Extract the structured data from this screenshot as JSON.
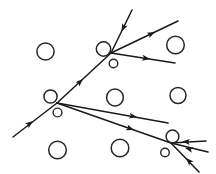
{
  "figure": {
    "width": 216,
    "height": 174,
    "background_color": "#ffffff",
    "stroke_color": "#1a1a1a",
    "circle_stroke_color": "#262626"
  },
  "scatterers": [
    {
      "name": "circle-top-left",
      "cx": 45.5,
      "cy": 51.5,
      "r": 8.6,
      "stroke_width": 1.5
    },
    {
      "name": "circle-vertex-a-left",
      "cx": 103.5,
      "cy": 49.0,
      "r": 7.2,
      "stroke_width": 1.5
    },
    {
      "name": "circle-vertex-a-small",
      "cx": 113.5,
      "cy": 63.5,
      "r": 4.3,
      "stroke_width": 1.4
    },
    {
      "name": "circle-top-right",
      "cx": 175.5,
      "cy": 45.0,
      "r": 8.8,
      "stroke_width": 1.5
    },
    {
      "name": "circle-vertex-b-left",
      "cx": 50.5,
      "cy": 96.5,
      "r": 6.6,
      "stroke_width": 1.5
    },
    {
      "name": "circle-vertex-b-small",
      "cx": 57.5,
      "cy": 112.5,
      "r": 4.4,
      "stroke_width": 1.4
    },
    {
      "name": "circle-center",
      "cx": 115.0,
      "cy": 97.5,
      "r": 8.4,
      "stroke_width": 1.5
    },
    {
      "name": "circle-mid-right",
      "cx": 178.0,
      "cy": 95.5,
      "r": 8.0,
      "stroke_width": 1.5
    },
    {
      "name": "circle-bottom-left",
      "cx": 57.5,
      "cy": 150.0,
      "r": 8.8,
      "stroke_width": 1.5
    },
    {
      "name": "circle-bottom-center",
      "cx": 120.0,
      "cy": 148.0,
      "r": 8.8,
      "stroke_width": 1.5
    },
    {
      "name": "circle-vertex-c-top",
      "cx": 172.5,
      "cy": 136.5,
      "r": 6.4,
      "stroke_width": 1.5
    },
    {
      "name": "circle-vertex-c-small",
      "cx": 165.0,
      "cy": 152.5,
      "r": 4.3,
      "stroke_width": 1.4
    }
  ],
  "vertices": [
    {
      "name": "vertex-a",
      "x": 111.0,
      "y": 53.0,
      "label": "upper scattering vertex"
    },
    {
      "name": "vertex-b",
      "x": 57.0,
      "y": 103.0,
      "label": "middle scattering vertex"
    },
    {
      "name": "vertex-c",
      "x": 171.0,
      "y": 143.0,
      "label": "lower-right scattering vertex"
    }
  ],
  "rays": [
    {
      "name": "ray-incoming-top",
      "direction": "down-left",
      "x1": 132.0,
      "y1": 10.0,
      "x2": 111.0,
      "y2": 53.0,
      "stroke_width": 1.5
    },
    {
      "name": "ray-vertex-a-to-upper-right",
      "direction": "up-right",
      "x1": 111.0,
      "y1": 53.0,
      "x2": 178.0,
      "y2": 21.0,
      "stroke_width": 1.5
    },
    {
      "name": "ray-vertex-a-to-right",
      "direction": "right",
      "x1": 111.0,
      "y1": 53.0,
      "x2": 175.0,
      "y2": 63.0,
      "stroke_width": 1.5
    },
    {
      "name": "ray-vertex-b-to-vertex-a",
      "direction": "up-right",
      "x1": 57.0,
      "y1": 103.0,
      "x2": 111.0,
      "y2": 53.0,
      "stroke_width": 1.5
    },
    {
      "name": "ray-incoming-lower-left",
      "direction": "up-right",
      "x1": 13.0,
      "y1": 137.0,
      "x2": 57.0,
      "y2": 103.0,
      "stroke_width": 1.5
    },
    {
      "name": "ray-vertex-b-to-right",
      "direction": "right-slight-down",
      "x1": 57.0,
      "y1": 103.0,
      "x2": 168.0,
      "y2": 123.0,
      "stroke_width": 1.5
    },
    {
      "name": "ray-vertex-b-to-vertex-c",
      "direction": "right-down",
      "x1": 57.0,
      "y1": 103.0,
      "x2": 171.0,
      "y2": 143.0,
      "stroke_width": 1.5
    },
    {
      "name": "ray-into-vertex-c-upper",
      "direction": "left-into-vertex",
      "x1": 206.0,
      "y1": 141.0,
      "x2": 171.0,
      "y2": 143.0,
      "stroke_width": 1.5
    },
    {
      "name": "ray-into-vertex-c-middle",
      "direction": "left-into-vertex",
      "x1": 208.0,
      "y1": 152.0,
      "x2": 171.0,
      "y2": 143.0,
      "stroke_width": 1.5
    },
    {
      "name": "ray-into-vertex-c-lower",
      "direction": "up-left-into-vertex",
      "x1": 199.0,
      "y1": 172.0,
      "x2": 171.0,
      "y2": 143.0,
      "stroke_width": 1.5
    }
  ],
  "arrowheads": [
    {
      "name": "arrow-incoming-top",
      "x": 121.5,
      "y": 31.5,
      "angle": 116,
      "size": 5.4
    },
    {
      "name": "arrow-vertex-a-upper-right",
      "x": 155.0,
      "y": 32.0,
      "angle": -25.5,
      "size": 5.4
    },
    {
      "name": "arrow-vertex-a-right",
      "x": 150.0,
      "y": 59.0,
      "angle": 8.9,
      "size": 5.4
    },
    {
      "name": "arrow-vertex-b-to-vertex-a",
      "x": 83.0,
      "y": 79.0,
      "angle": -42.8,
      "size": 5.4
    },
    {
      "name": "arrow-incoming-lower-left",
      "x": 33.0,
      "y": 121.0,
      "angle": -37.7,
      "size": 5.4
    },
    {
      "name": "arrow-vertex-b-right",
      "x": 137.0,
      "y": 117.0,
      "angle": 10.2,
      "size": 5.4
    },
    {
      "name": "arrow-vertex-b-to-vertex-c",
      "x": 134.0,
      "y": 130.0,
      "angle": 19.3,
      "size": 5.4
    },
    {
      "name": "arrow-into-vertex-c-upper",
      "x": 182.0,
      "y": 141.5,
      "angle": 183.3,
      "size": 5.4
    },
    {
      "name": "arrow-into-vertex-c-middle",
      "x": 185.0,
      "y": 148.0,
      "angle": 193.7,
      "size": 5.4
    },
    {
      "name": "arrow-into-vertex-c-lower",
      "x": 186.0,
      "y": 158.0,
      "angle": 226.0,
      "size": 5.4
    }
  ]
}
